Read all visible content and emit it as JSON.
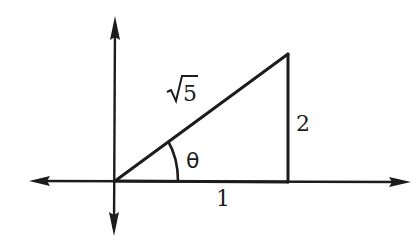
{
  "diagram": {
    "type": "right-triangle-on-coordinate-axes",
    "colors": {
      "ink": "#1c1c1c",
      "background": "#ffffff"
    },
    "axes": {
      "x_axis": {
        "arrows": [
          "left",
          "right"
        ]
      },
      "y_axis": {
        "arrows": [
          "up",
          "down"
        ]
      }
    },
    "triangle": {
      "vertices": {
        "origin": [
          0,
          0
        ],
        "right_angle_vertex": [
          1,
          0
        ],
        "top_vertex": [
          1,
          2
        ]
      },
      "sides": {
        "adjacent": {
          "label": "1",
          "value": 1
        },
        "opposite": {
          "label": "2",
          "value": 2
        },
        "hypotenuse": {
          "label": "√5",
          "radicand": "5",
          "value_expr": "sqrt(5)"
        }
      },
      "angle": {
        "label": "θ",
        "at": "origin"
      }
    },
    "labels": {
      "hypotenuse": "√5",
      "opposite": "2",
      "adjacent": "1",
      "angle": "θ"
    }
  }
}
